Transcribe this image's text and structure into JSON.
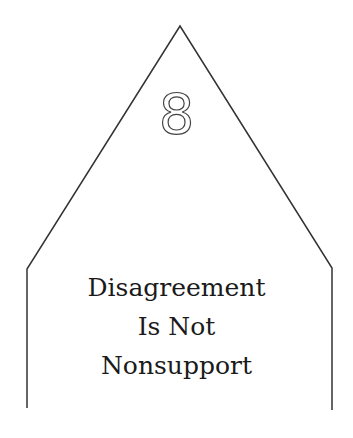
{
  "card": {
    "number": "8",
    "title_lines": [
      "Disagreement",
      "Is Not",
      "Nonsupport"
    ],
    "outline_color": "#333333"
  }
}
